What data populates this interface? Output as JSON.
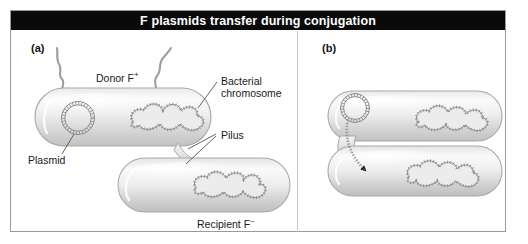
{
  "figure": {
    "title": "F plasmids transfer during conjugation",
    "title_background": "#0a0a0a",
    "title_color": "#ffffff",
    "frame_border_color": "#9a9a9a",
    "background": "#ffffff"
  },
  "panels": [
    {
      "id": "a",
      "label": "(a)",
      "annotations": [
        {
          "name": "donor-label",
          "text": "Donor F",
          "superscript": "+"
        },
        {
          "name": "bacterial-chromosome-label",
          "line1": "Bacterial",
          "line2": "chromosome"
        },
        {
          "name": "pilus-label",
          "text": "Pilus"
        },
        {
          "name": "plasmid-label",
          "text": "Plasmid"
        },
        {
          "name": "recipient-label",
          "text": "Recipient F",
          "superscript": "–"
        }
      ],
      "cells": [
        {
          "name": "donor-cell",
          "contents": [
            "plasmid-circle",
            "bacterial-chromosome"
          ]
        },
        {
          "name": "recipient-cell",
          "contents": [
            "bacterial-chromosome"
          ]
        }
      ]
    },
    {
      "id": "b",
      "label": "(b)",
      "annotations": [],
      "cells": [
        {
          "name": "donor-cell",
          "contents": [
            "plasmid-circle",
            "plasmid-transfer-strand",
            "bacterial-chromosome"
          ]
        },
        {
          "name": "recipient-cell",
          "contents": [
            "bacterial-chromosome"
          ]
        }
      ]
    }
  ],
  "colors": {
    "cell_fill_light": "#f2f2f2",
    "cell_fill_mid": "#d3d3d3",
    "cell_outline": "#a8a8a8",
    "dna_outline": "#8a8a8a",
    "dna_fill": "#e6e6e6",
    "leader_line": "#4d4d4d",
    "arrowhead": "#1a1a1a"
  }
}
